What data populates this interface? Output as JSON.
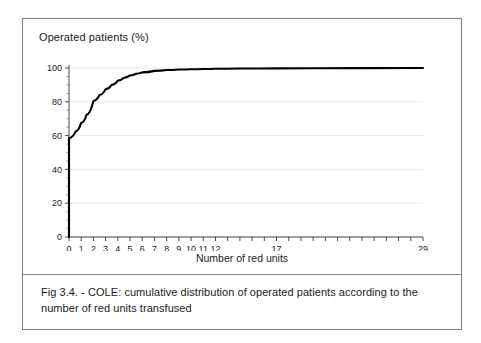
{
  "figure": {
    "caption": "Fig 3.4. - COLE: cumulative distribution of operated patients according to the number of red units transfused"
  },
  "chart_data": {
    "type": "line",
    "title": "",
    "ylabel": "Operated patients (%)",
    "xlabel": "Number of red units",
    "xlim": [
      0,
      29
    ],
    "ylim": [
      0,
      100
    ],
    "grid": true,
    "legend": null,
    "y_ticks": [
      0,
      20,
      40,
      60,
      80,
      100
    ],
    "y_minor_tick_step": 5,
    "x_ticks": [
      0,
      1,
      2,
      3,
      4,
      5,
      6,
      7,
      8,
      9,
      10,
      11,
      12,
      13,
      14,
      15,
      16,
      17,
      18,
      19,
      20,
      21,
      22,
      23,
      24,
      25,
      26,
      27,
      28,
      29
    ],
    "x_tick_labels": [
      "0",
      "1",
      "2",
      "3",
      "4",
      "5",
      "6",
      "7",
      "8",
      "9",
      "10",
      "11",
      "12",
      "",
      "",
      "",
      "",
      "17",
      "",
      "",
      "",
      "",
      "",
      "",
      "",
      "",
      "",
      "",
      "",
      "29"
    ],
    "line_color": "#000000",
    "line_width": 2.1,
    "series": [
      {
        "name": "Cumulative % of operated patients",
        "x": [
          0,
          0,
          0.55,
          1.0,
          1.45,
          2.0,
          2.5,
          3.0,
          3.5,
          4.0,
          4.5,
          5.0,
          5.5,
          6.0,
          7.0,
          8.0,
          9.0,
          10.0,
          11.0,
          12.0,
          14.0,
          17.0,
          20.0,
          24.0,
          29.0
        ],
        "y": [
          0,
          58.5,
          62.5,
          67.5,
          72.5,
          80.5,
          84.0,
          87.5,
          90.0,
          92.5,
          94.2,
          95.6,
          96.6,
          97.4,
          98.3,
          98.8,
          99.1,
          99.3,
          99.45,
          99.6,
          99.7,
          99.8,
          99.88,
          99.94,
          100.0
        ]
      }
    ]
  }
}
